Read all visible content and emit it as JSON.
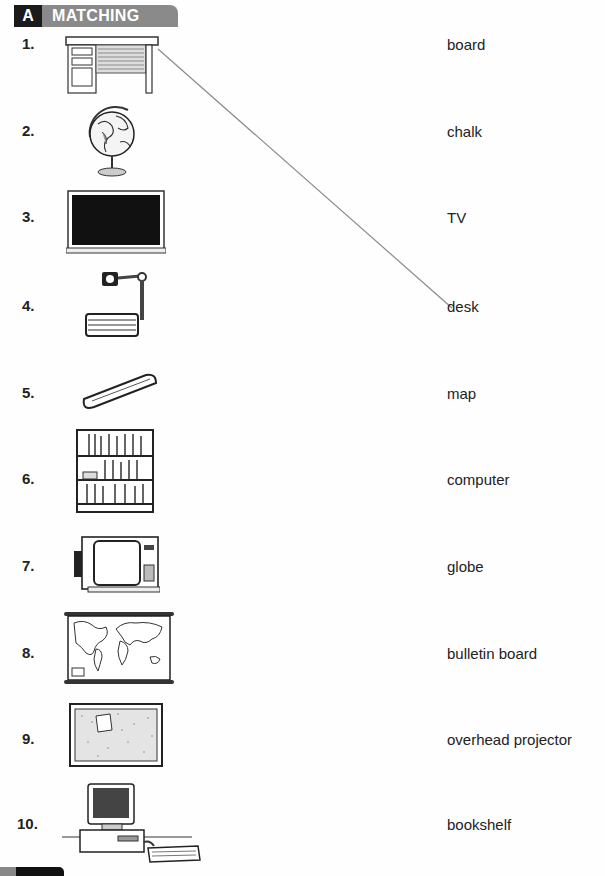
{
  "section": {
    "letter": "A",
    "title": "MATCHING"
  },
  "items": [
    {
      "number": "1.",
      "picture": "desk-illustration"
    },
    {
      "number": "2.",
      "picture": "globe-illustration"
    },
    {
      "number": "3.",
      "picture": "board-illustration"
    },
    {
      "number": "4.",
      "picture": "overhead-projector-illustration"
    },
    {
      "number": "5.",
      "picture": "chalk-illustration"
    },
    {
      "number": "6.",
      "picture": "bookshelf-illustration"
    },
    {
      "number": "7.",
      "picture": "tv-illustration"
    },
    {
      "number": "8.",
      "picture": "map-illustration"
    },
    {
      "number": "9.",
      "picture": "bulletin-board-illustration"
    },
    {
      "number": "10.",
      "picture": "computer-illustration"
    }
  ],
  "words": [
    "board",
    "chalk",
    "TV",
    "desk",
    "map",
    "computer",
    "globe",
    "bulletin board",
    "overhead projector",
    "bookshelf"
  ],
  "example_match": {
    "item": "1.",
    "word": "desk",
    "line_color": "#8a8a8a"
  }
}
